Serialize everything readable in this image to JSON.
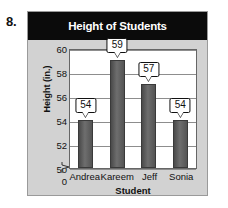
{
  "problem": {
    "number": "8."
  },
  "chart_data": {
    "type": "bar",
    "title": "Height of Students",
    "xlabel": "Student",
    "ylabel": "Height (in.)",
    "categories": [
      "Andrea",
      "Kareem",
      "Jeff",
      "Sonia"
    ],
    "values": [
      54,
      59,
      57,
      54
    ],
    "data_labels": [
      "54",
      "59",
      "57",
      "54"
    ],
    "ylim": [
      50,
      60
    ],
    "ytick_labels": [
      "60",
      "58",
      "56",
      "54",
      "52",
      "50",
      "0"
    ],
    "yticks": [
      60,
      58,
      56,
      54,
      52,
      50,
      0
    ],
    "axis_break": true,
    "grid": true,
    "legend": "none",
    "colors": {
      "title_bar_bg": "#0b0b0b",
      "title_text": "#ffffff",
      "panel_bg": "#d2d2d2",
      "plot_bg": "#ffffff",
      "bar_fill": "#5a5a5a",
      "gridline": "#8d8d8d",
      "axis": "#666666",
      "text": "#111111"
    }
  }
}
